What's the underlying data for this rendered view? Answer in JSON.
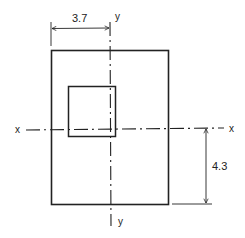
{
  "diagram": {
    "type": "cross-section",
    "colors": {
      "stroke": "#222222",
      "background": "#ffffff"
    },
    "axes": {
      "x_left_label": "x",
      "x_right_label": "x",
      "y_top_label": "y",
      "y_bottom_label": "y"
    },
    "dimensions": {
      "horizontal": {
        "label": "3.7",
        "meaning": "distance from left edge to y-y axis"
      },
      "vertical": {
        "label": "4.3",
        "meaning": "distance from bottom edge to x-x axis"
      }
    },
    "shapes": {
      "outer_rectangle": {
        "x": 51,
        "y": 50,
        "width": 117,
        "height": 154
      },
      "inner_square": {
        "x": 68,
        "y": 86,
        "width": 47,
        "height": 50
      }
    }
  }
}
